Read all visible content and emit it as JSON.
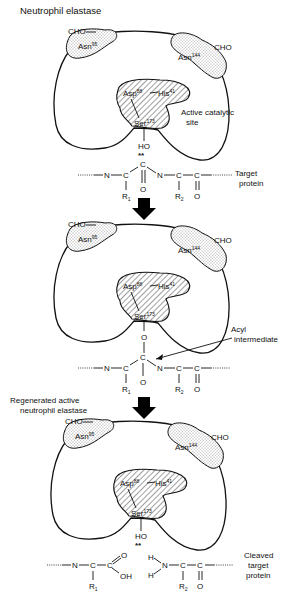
{
  "figure": {
    "title": "Neutrophil elastase",
    "arrow_color": "#000000",
    "panels": [
      {
        "id": "panel-1",
        "label_top": "Neutrophil elastase",
        "glyco_left": {
          "group": "CHO",
          "residue": "Asn",
          "position": "95"
        },
        "glyco_right": {
          "group": "CHO",
          "residue": "Asn",
          "position": "144"
        },
        "triad": {
          "asp": "Asp",
          "asp_pos": "88",
          "his": "His",
          "his_pos": "41",
          "ser": "Ser",
          "ser_pos": "173"
        },
        "site_label_1": "Active catalytic",
        "site_label_2": "site",
        "nucleophile": "HO",
        "electron_pair": "**",
        "substrate": {
          "N1": "N",
          "C1": "C",
          "R1": "R",
          "R1_sub": "1",
          "C2": "C",
          "O2": "O",
          "N2": "N",
          "C3": "C",
          "R2": "R",
          "R2_sub": "2",
          "C4": "C",
          "O4": "O"
        },
        "right_label_1": "Target",
        "right_label_2": "protein"
      },
      {
        "id": "panel-2",
        "glyco_left": {
          "group": "CHO",
          "residue": "Asn",
          "position": "95"
        },
        "glyco_right": {
          "group": "CHO",
          "residue": "Asn",
          "position": "144"
        },
        "triad": {
          "asp": "Asp",
          "asp_pos": "88",
          "his": "His",
          "his_pos": "41",
          "ser": "Ser",
          "ser_pos": "173"
        },
        "linker": "O",
        "substrate": {
          "N1": "N",
          "C1": "C",
          "R1": "R",
          "R1_sub": "1",
          "C2": "C",
          "O2": "O",
          "N2": "N",
          "C3": "C",
          "R2": "R",
          "R2_sub": "2",
          "C4": "C",
          "O4": "O"
        },
        "callout_1": "Acyl",
        "callout_2": "intermediate"
      },
      {
        "id": "panel-3",
        "label_top_1": "Regenerated active",
        "label_top_2": "neutrophil elastase",
        "glyco_left": {
          "group": "CHO",
          "residue": "Asn",
          "position": "95"
        },
        "glyco_right": {
          "group": "CHO",
          "residue": "Asn",
          "position": "144"
        },
        "triad": {
          "asp": "Asp",
          "asp_pos": "88",
          "his": "His",
          "his_pos": "41",
          "ser": "Ser",
          "ser_pos": "173"
        },
        "nucleophile": "HO",
        "electron_pair": "**",
        "product_left": {
          "N": "N",
          "C1": "C",
          "R1": "R",
          "R1_sub": "1",
          "C2": "C",
          "O": "O",
          "OH": "OH"
        },
        "product_right": {
          "H1": "H",
          "H2": "H",
          "N": "N",
          "C3": "C",
          "R2": "R",
          "R2_sub": "2",
          "C4": "C",
          "O4": "O"
        },
        "right_label_1": "Cleaved",
        "right_label_2": "target",
        "right_label_3": "protein"
      }
    ]
  }
}
